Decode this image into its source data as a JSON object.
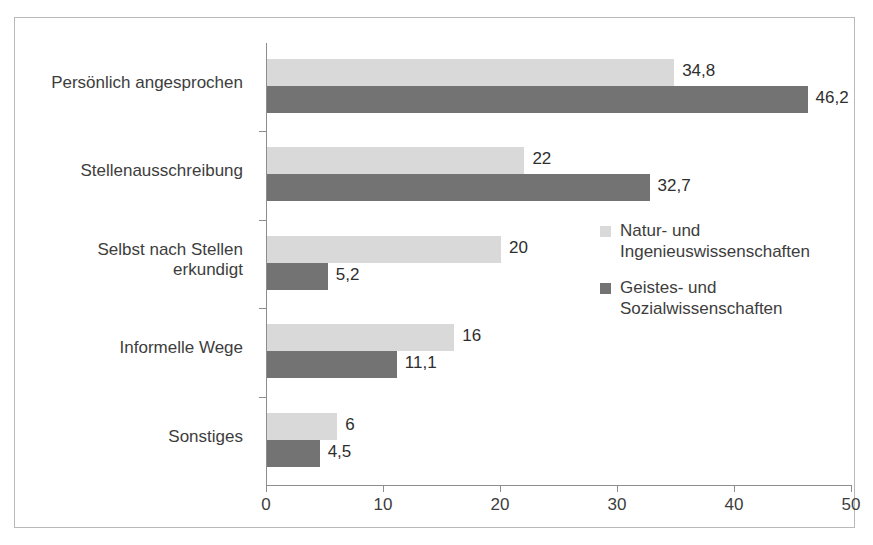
{
  "title": {
    "text": "Abbildung 5: Wege in die aktuelle Beschäftigung nach Fächergruppen (in %)"
  },
  "chart_data": {
    "type": "bar",
    "orientation": "horizontal",
    "title": "",
    "xlabel": "",
    "ylabel": "",
    "xlim": [
      0,
      50
    ],
    "xticks": [
      "0",
      "10",
      "20",
      "30",
      "40",
      "50"
    ],
    "xtick_values": [
      0,
      10,
      20,
      30,
      40,
      50
    ],
    "grid": false,
    "legend_position": "right",
    "categories": [
      "Persönlich angesprochen",
      "Stellenausschreibung",
      "Selbst nach Stellen erkundigt",
      "Informelle Wege",
      "Sonstiges"
    ],
    "series": [
      {
        "name": "Natur- und Ingenieuswissenschaften",
        "color": "#d9d9d9",
        "values": [
          34.8,
          22,
          20,
          16,
          6
        ],
        "labels": [
          "34,8",
          "22",
          "20",
          "16",
          "6"
        ]
      },
      {
        "name": "Geistes- und Sozialwissenschaften",
        "color": "#737373",
        "values": [
          46.2,
          32.7,
          5.2,
          11.1,
          4.5
        ],
        "labels": [
          "46,2",
          "32,7",
          "5,2",
          "11,1",
          "4,5"
        ]
      }
    ]
  },
  "legend": {
    "entries": [
      {
        "swatch": "light",
        "line1": "Natur- und",
        "line2": "Ingenieuswissenschaften"
      },
      {
        "swatch": "dark",
        "line1": "Geistes- und",
        "line2": "Sozialwissenschaften"
      }
    ]
  },
  "category_labels": [
    {
      "line1": "Persönlich angesprochen",
      "line2": ""
    },
    {
      "line1": "Stellenausschreibung",
      "line2": ""
    },
    {
      "line1": "Selbst nach Stellen",
      "line2": "erkundigt"
    },
    {
      "line1": "Informelle Wege",
      "line2": ""
    },
    {
      "line1": "Sonstiges",
      "line2": ""
    }
  ]
}
